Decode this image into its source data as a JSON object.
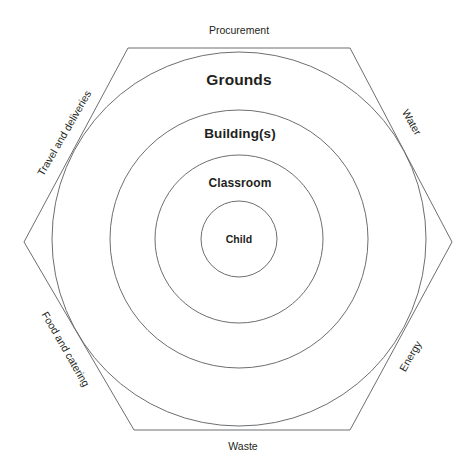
{
  "diagram": {
    "type": "concentric-rings-in-hexagon",
    "background_color": "#ffffff",
    "stroke_color": "#58585a",
    "text_color": "#231f20",
    "rings": [
      {
        "id": "grounds",
        "label": "Grounds",
        "radius": 187,
        "level": 1
      },
      {
        "id": "buildings",
        "label": "Building(s)",
        "radius": 129,
        "level": 2
      },
      {
        "id": "classroom",
        "label": "Classroom",
        "radius": 84,
        "level": 3
      },
      {
        "id": "child",
        "label": "Child",
        "radius": 38,
        "level": 4
      }
    ],
    "hexagon": {
      "center_x": 239,
      "center_y": 239,
      "points": "128,48 350,48 452,242 350,430 134,430 24,242",
      "edges": [
        {
          "id": "procurement",
          "label": "Procurement",
          "position": "top",
          "rotation": 0
        },
        {
          "id": "water",
          "label": "Water",
          "position": "upper-right",
          "rotation": 60
        },
        {
          "id": "energy",
          "label": "Energy",
          "position": "lower-right",
          "rotation": -60
        },
        {
          "id": "waste",
          "label": "Waste",
          "position": "bottom",
          "rotation": 0
        },
        {
          "id": "food",
          "label": "Food and catering",
          "position": "lower-left",
          "rotation": 60
        },
        {
          "id": "travel",
          "label": "Travel and deliveries",
          "position": "upper-left",
          "rotation": -60
        }
      ]
    }
  }
}
